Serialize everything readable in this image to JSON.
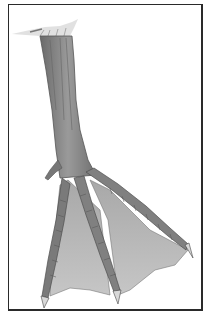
{
  "image": {
    "subject": "pencil illustration of a webbed duck foot",
    "frame_color": "#2a2a2a",
    "background": "#ffffff",
    "colors": {
      "shank": "#8a8a8a",
      "shank_dark": "#5e5e5e",
      "toe": "#7a7a7a",
      "web": "#b4b4b4",
      "claw": "#d8d8d8"
    }
  },
  "caption": {
    "text": "... .. . .. . ."
  }
}
